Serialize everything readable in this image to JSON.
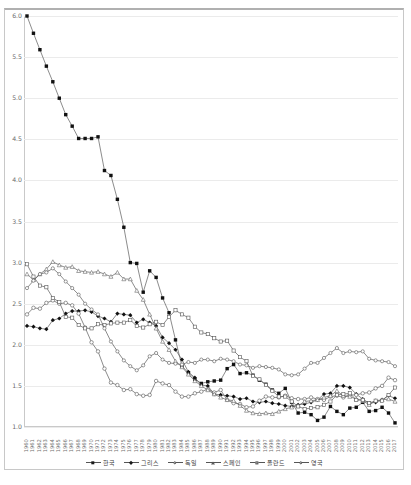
{
  "chart_data": {
    "type": "line",
    "title": "",
    "xlabel": "",
    "ylabel": "",
    "ylim": [
      1.0,
      6.0
    ],
    "ytick_step": 0.5,
    "grid": true,
    "legend_position": "bottom",
    "yticks": [
      "6.0",
      "5.5",
      "5.0",
      "4.5",
      "4.0",
      "3.5",
      "3.0",
      "2.5",
      "2.0",
      "1.5",
      "1.0"
    ],
    "x": [
      1960,
      1961,
      1962,
      1963,
      1964,
      1965,
      1966,
      1967,
      1968,
      1969,
      1970,
      1971,
      1972,
      1973,
      1974,
      1975,
      1976,
      1977,
      1978,
      1979,
      1980,
      1981,
      1982,
      1983,
      1984,
      1985,
      1986,
      1987,
      1988,
      1989,
      1990,
      1991,
      1992,
      1993,
      1994,
      1995,
      1996,
      1997,
      1998,
      1999,
      2000,
      2001,
      2002,
      2003,
      2004,
      2005,
      2006,
      2007,
      2008,
      2009,
      2010,
      2011,
      2012,
      2013,
      2014,
      2015,
      2016,
      2017
    ],
    "series": [
      {
        "name": "한국",
        "marker": "filled-square",
        "values": [
          6.0,
          5.79,
          5.59,
          5.39,
          5.2,
          5.0,
          4.8,
          4.66,
          4.51,
          4.51,
          4.51,
          4.53,
          4.12,
          4.06,
          3.77,
          3.43,
          3.0,
          2.99,
          2.64,
          2.9,
          2.82,
          2.57,
          2.39,
          2.06,
          1.74,
          1.66,
          1.58,
          1.53,
          1.55,
          1.56,
          1.57,
          1.71,
          1.76,
          1.65,
          1.66,
          1.63,
          1.57,
          1.52,
          1.45,
          1.41,
          1.47,
          1.3,
          1.17,
          1.18,
          1.15,
          1.08,
          1.12,
          1.25,
          1.19,
          1.15,
          1.23,
          1.24,
          1.3,
          1.19,
          1.2,
          1.24,
          1.17,
          1.05
        ]
      },
      {
        "name": "그리스",
        "marker": "filled-diamond",
        "values": [
          2.23,
          2.22,
          2.2,
          2.19,
          2.3,
          2.32,
          2.38,
          2.41,
          2.41,
          2.42,
          2.4,
          2.35,
          2.32,
          2.28,
          2.38,
          2.37,
          2.36,
          2.27,
          2.31,
          2.27,
          2.23,
          2.09,
          2.02,
          1.94,
          1.82,
          1.67,
          1.6,
          1.51,
          1.5,
          1.4,
          1.39,
          1.38,
          1.37,
          1.34,
          1.35,
          1.31,
          1.3,
          1.31,
          1.29,
          1.28,
          1.26,
          1.25,
          1.27,
          1.28,
          1.3,
          1.33,
          1.4,
          1.41,
          1.5,
          1.5,
          1.48,
          1.4,
          1.34,
          1.29,
          1.3,
          1.33,
          1.38,
          1.35
        ]
      },
      {
        "name": "독일",
        "marker": "open-circle",
        "values": [
          2.37,
          2.45,
          2.44,
          2.51,
          2.54,
          2.5,
          2.51,
          2.48,
          2.38,
          2.21,
          2.03,
          1.92,
          1.71,
          1.54,
          1.51,
          1.45,
          1.46,
          1.4,
          1.38,
          1.39,
          1.56,
          1.53,
          1.51,
          1.43,
          1.37,
          1.37,
          1.41,
          1.43,
          1.46,
          1.42,
          1.45,
          1.33,
          1.29,
          1.28,
          1.24,
          1.25,
          1.32,
          1.37,
          1.36,
          1.36,
          1.38,
          1.35,
          1.34,
          1.34,
          1.36,
          1.34,
          1.33,
          1.37,
          1.38,
          1.36,
          1.39,
          1.39,
          1.41,
          1.42,
          1.47,
          1.5,
          1.6,
          1.57
        ]
      },
      {
        "name": "스페인",
        "marker": "open-triangle",
        "values": [
          2.86,
          2.79,
          2.86,
          2.92,
          3.01,
          2.97,
          2.94,
          2.95,
          2.9,
          2.89,
          2.88,
          2.89,
          2.86,
          2.83,
          2.88,
          2.8,
          2.8,
          2.66,
          2.55,
          2.37,
          2.2,
          2.04,
          1.94,
          1.8,
          1.73,
          1.64,
          1.56,
          1.5,
          1.45,
          1.4,
          1.36,
          1.33,
          1.32,
          1.26,
          1.2,
          1.17,
          1.16,
          1.17,
          1.16,
          1.19,
          1.22,
          1.24,
          1.26,
          1.31,
          1.32,
          1.33,
          1.36,
          1.38,
          1.44,
          1.38,
          1.37,
          1.34,
          1.32,
          1.27,
          1.32,
          1.33,
          1.34,
          1.31
        ]
      },
      {
        "name": "폴란드",
        "marker": "open-square",
        "values": [
          2.98,
          2.83,
          2.72,
          2.7,
          2.57,
          2.52,
          2.34,
          2.33,
          2.24,
          2.2,
          2.2,
          2.25,
          2.24,
          2.26,
          2.27,
          2.27,
          2.3,
          2.23,
          2.21,
          2.25,
          2.28,
          2.24,
          2.34,
          2.42,
          2.37,
          2.33,
          2.22,
          2.15,
          2.13,
          2.08,
          2.04,
          2.05,
          1.93,
          1.85,
          1.8,
          1.62,
          1.58,
          1.51,
          1.44,
          1.37,
          1.37,
          1.31,
          1.25,
          1.22,
          1.23,
          1.24,
          1.27,
          1.31,
          1.39,
          1.4,
          1.41,
          1.33,
          1.33,
          1.29,
          1.32,
          1.32,
          1.39,
          1.48
        ]
      },
      {
        "name": "영국",
        "marker": "open-circle-small",
        "values": [
          2.69,
          2.78,
          2.86,
          2.88,
          2.93,
          2.86,
          2.77,
          2.69,
          2.61,
          2.5,
          2.43,
          2.37,
          2.2,
          2.04,
          1.92,
          1.81,
          1.74,
          1.69,
          1.75,
          1.86,
          1.9,
          1.82,
          1.78,
          1.77,
          1.76,
          1.79,
          1.78,
          1.82,
          1.82,
          1.8,
          1.83,
          1.82,
          1.8,
          1.76,
          1.75,
          1.72,
          1.74,
          1.73,
          1.72,
          1.7,
          1.64,
          1.63,
          1.64,
          1.71,
          1.78,
          1.78,
          1.84,
          1.9,
          1.96,
          1.9,
          1.92,
          1.91,
          1.92,
          1.83,
          1.81,
          1.8,
          1.79,
          1.74
        ]
      }
    ]
  },
  "legend": {
    "items": [
      {
        "label": "한국",
        "marker": "filled-square"
      },
      {
        "label": "그리스",
        "marker": "filled-diamond"
      },
      {
        "label": "독일",
        "marker": "open-circle"
      },
      {
        "label": "스페인",
        "marker": "open-triangle"
      },
      {
        "label": "폴란드",
        "marker": "open-square"
      },
      {
        "label": "영국",
        "marker": "open-circle-small"
      }
    ]
  },
  "footnote": {
    "text": ""
  }
}
